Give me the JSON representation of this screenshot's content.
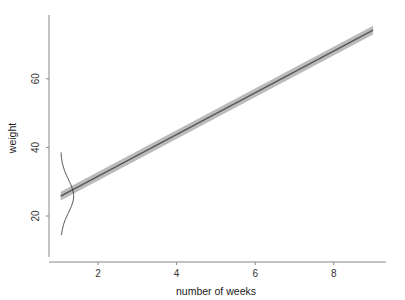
{
  "chart_data": {
    "type": "line",
    "title": "",
    "xlabel": "number of weeks",
    "ylabel": "weight",
    "xlim": [
      0.7,
      9.3
    ],
    "ylim": [
      7.5,
      78
    ],
    "x_ticks": [
      2,
      4,
      6,
      8
    ],
    "y_ticks": [
      20,
      40,
      60
    ],
    "x_tick_labels": [
      "2",
      "4",
      "6",
      "8"
    ],
    "y_tick_labels": [
      "20",
      "40",
      "60"
    ],
    "grid": false,
    "legend": "none",
    "series": [
      {
        "name": "regression line",
        "x": [
          1.05,
          9.0
        ],
        "y": [
          25.8,
          74.2
        ],
        "color": "#555555",
        "band_halfwidth": 1.3,
        "band_color": "#bbbbbb"
      }
    ],
    "annotations": [
      {
        "type": "normal-density-curve",
        "at_x": 1.05,
        "mean": 25.8,
        "sd": 4.8,
        "y_range": [
          14.5,
          38.5
        ],
        "peak_x_offset_weeks": 0.33,
        "color": "#333333"
      }
    ]
  }
}
